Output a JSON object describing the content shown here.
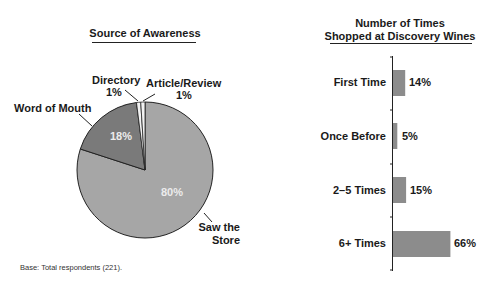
{
  "chart_data": [
    {
      "type": "pie",
      "title": "Source of Awareness",
      "slices": [
        {
          "label": "Saw the Store",
          "value": 80,
          "display": "80%",
          "color": "#a6a6a6"
        },
        {
          "label": "Word of Mouth",
          "value": 18,
          "display": "18%",
          "color": "#7a7a7a"
        },
        {
          "label": "Directory",
          "value": 1,
          "display": "1%",
          "color": "#f2f2f2"
        },
        {
          "label": "Article/Review",
          "value": 1,
          "display": "1%",
          "color": "#f2f2f2"
        }
      ],
      "labels": {
        "word_of_mouth": "Word of Mouth",
        "directory": "Directory",
        "directory_pct": "1%",
        "article": "Article/Review",
        "article_pct": "1%",
        "saw_line1": "Saw the",
        "saw_line2": "Store",
        "pct_80": "80%",
        "pct_18": "18%"
      }
    },
    {
      "type": "bar",
      "orientation": "horizontal",
      "title": "Number of Times Shopped at Discovery Wines",
      "title_line1": "Number of Times",
      "title_line2": "Shopped at Discovery Wines",
      "categories": [
        "First Time",
        "Once Before",
        "2–5 Times",
        "6+ Times"
      ],
      "values": [
        14,
        5,
        15,
        66
      ],
      "display": [
        "14%",
        "5%",
        "15%",
        "66%"
      ],
      "xlabel": "",
      "ylabel": "",
      "bar_color": "#8c8c8c",
      "grid": false
    }
  ],
  "footnote": "Base: Total respondents (221)."
}
